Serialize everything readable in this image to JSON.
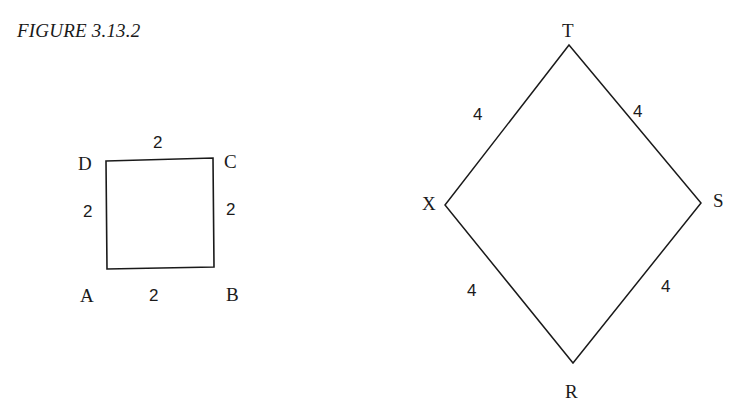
{
  "figure": {
    "caption": "FIGURE 3.13.2"
  },
  "square": {
    "vertices": {
      "A": {
        "label": "A",
        "x": 107,
        "y": 269
      },
      "B": {
        "label": "B",
        "x": 214,
        "y": 267
      },
      "C": {
        "label": "C",
        "x": 213,
        "y": 158
      },
      "D": {
        "label": "D",
        "x": 106,
        "y": 161
      }
    },
    "side_labels": {
      "top": "2",
      "left": "2",
      "right": "2",
      "bottom": "2"
    }
  },
  "rhombus": {
    "vertices": {
      "T": {
        "label": "T",
        "x": 569,
        "y": 45
      },
      "S": {
        "label": "S",
        "x": 701,
        "y": 203
      },
      "R": {
        "label": "R",
        "x": 573,
        "y": 363
      },
      "X": {
        "label": "X",
        "x": 445,
        "y": 205
      }
    },
    "side_labels": {
      "XT": "4",
      "TS": "4",
      "XR": "4",
      "RS": "4"
    }
  },
  "colors": {
    "stroke": "#1a1a1a",
    "background": "#ffffff"
  }
}
